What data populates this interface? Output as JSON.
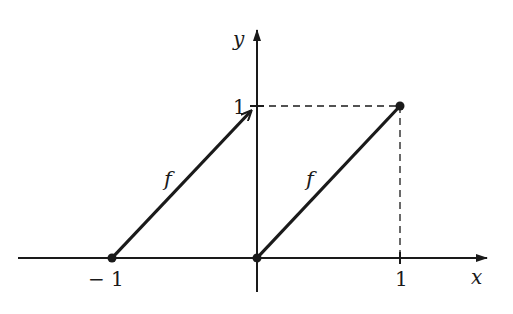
{
  "diagram": {
    "type": "function-graph",
    "axes": {
      "x_label": "x",
      "y_label": "y",
      "x_ticks": [
        {
          "value": -1,
          "label": "− 1"
        },
        {
          "value": 1,
          "label": "1"
        }
      ],
      "y_ticks": [
        {
          "value": 1,
          "label": "1"
        }
      ]
    },
    "segments": [
      {
        "name": "left-segment",
        "label": "f",
        "from": [
          -1,
          0
        ],
        "to": [
          0,
          1
        ],
        "start_marker": "filled-dot",
        "end_marker": "arrowhead"
      },
      {
        "name": "right-segment",
        "label": "f",
        "from": [
          0,
          0
        ],
        "to": [
          1,
          1
        ],
        "start_marker": "filled-dot",
        "end_marker": "filled-dot"
      }
    ],
    "guides": [
      {
        "style": "dashed",
        "from": [
          0,
          1
        ],
        "to": [
          1,
          1
        ]
      },
      {
        "style": "dashed",
        "from": [
          1,
          1
        ],
        "to": [
          1,
          0
        ]
      }
    ],
    "colors": {
      "ink": "#1a1a1a",
      "background": "#ffffff"
    }
  }
}
